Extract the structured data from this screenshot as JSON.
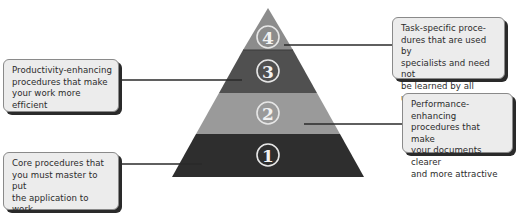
{
  "pyramid": {
    "levels": [
      {
        "number": "1",
        "fill": "#2e2e2e"
      },
      {
        "number": "2",
        "fill": "#9a9a9a"
      },
      {
        "number": "3",
        "fill": "#505050"
      },
      {
        "number": "4",
        "fill": "#8c8c8c"
      }
    ],
    "numeral_ring_color": "#e6e6e6"
  },
  "callouts": {
    "level4": {
      "text": "Task-specific proce-\ndures that are used by\nspecialists and need not\nbe learned by all users"
    },
    "level3": {
      "text": "Productivity-enhancing\nprocedures that make\nyour work more efficient"
    },
    "level2": {
      "text": "Performance-enhancing\nprocedures that make\nyour documents clearer\nand more attractive"
    },
    "level1": {
      "text": "Core procedures that\nyou must master to put\nthe application to work\nfor you"
    }
  }
}
